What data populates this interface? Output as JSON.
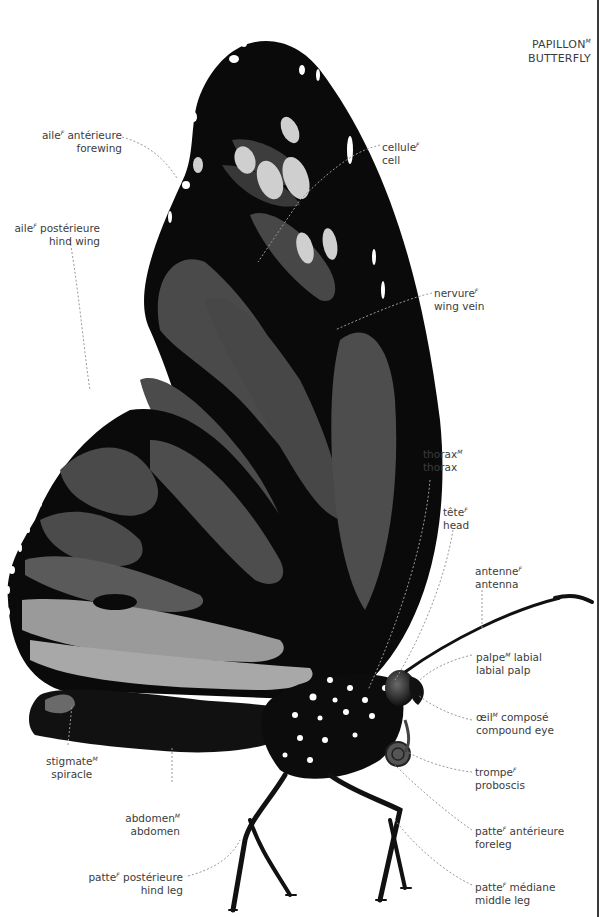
{
  "title": {
    "fr": "PAPILLON",
    "gender": "M",
    "en": "BUTTERFLY"
  },
  "labels": {
    "forewing": {
      "fr": "aile",
      "gender": "F",
      "fr_rest": " antérieure",
      "en": "forewing"
    },
    "hind_wing": {
      "fr": "aile",
      "gender": "F",
      "fr_rest": " postérieure",
      "en": "hind wing"
    },
    "cell": {
      "fr": "cellule",
      "gender": "F",
      "fr_rest": "",
      "en": "cell"
    },
    "wing_vein": {
      "fr": "nervure",
      "gender": "F",
      "fr_rest": "",
      "en": "wing vein"
    },
    "thorax": {
      "fr": "thorax",
      "gender": "M",
      "fr_rest": "",
      "en": "thorax"
    },
    "head": {
      "fr": "tête",
      "gender": "F",
      "fr_rest": "",
      "en": "head"
    },
    "antenna": {
      "fr": "antenne",
      "gender": "F",
      "fr_rest": "",
      "en": "antenna"
    },
    "labial_palp": {
      "fr": "palpe",
      "gender": "M",
      "fr_rest": " labial",
      "en": "labial palp"
    },
    "compound_eye": {
      "fr": "œil",
      "gender": "M",
      "fr_rest": " composé",
      "en": "compound eye"
    },
    "proboscis": {
      "fr": "trompe",
      "gender": "F",
      "fr_rest": "",
      "en": "proboscis"
    },
    "foreleg": {
      "fr": "patte",
      "gender": "F",
      "fr_rest": " antérieure",
      "en": "foreleg"
    },
    "middle_leg": {
      "fr": "patte",
      "gender": "F",
      "fr_rest": " médiane",
      "en": "middle leg"
    },
    "hind_leg": {
      "fr": "patte",
      "gender": "F",
      "fr_rest": " postérieure",
      "en": "hind leg"
    },
    "abdomen": {
      "fr": "abdomen",
      "gender": "M",
      "fr_rest": "",
      "en": "abdomen"
    },
    "spiracle": {
      "fr": "stigmate",
      "gender": "M",
      "fr_rest": "",
      "en": "spiracle"
    }
  },
  "colors": {
    "wing_black": "#0a0a0a",
    "wing_panel": "#4a4a4a",
    "wing_light": "#cfcfcf",
    "label_text": "#3c3c3c",
    "leader_line": "#9a9a9a"
  }
}
